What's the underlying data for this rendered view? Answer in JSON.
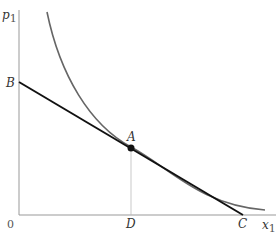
{
  "diagram": {
    "axes": {
      "y_label": "p",
      "y_label_sub": "1",
      "x_label": "x",
      "x_label_sub": "1",
      "origin_label": "0"
    },
    "points": {
      "A": "A",
      "B": "B",
      "C": "C",
      "D": "D"
    },
    "colors": {
      "budget_line": "#111111",
      "indifference_curve": "#666666",
      "axes": "#999999",
      "guide": "#bbbbbb"
    }
  }
}
